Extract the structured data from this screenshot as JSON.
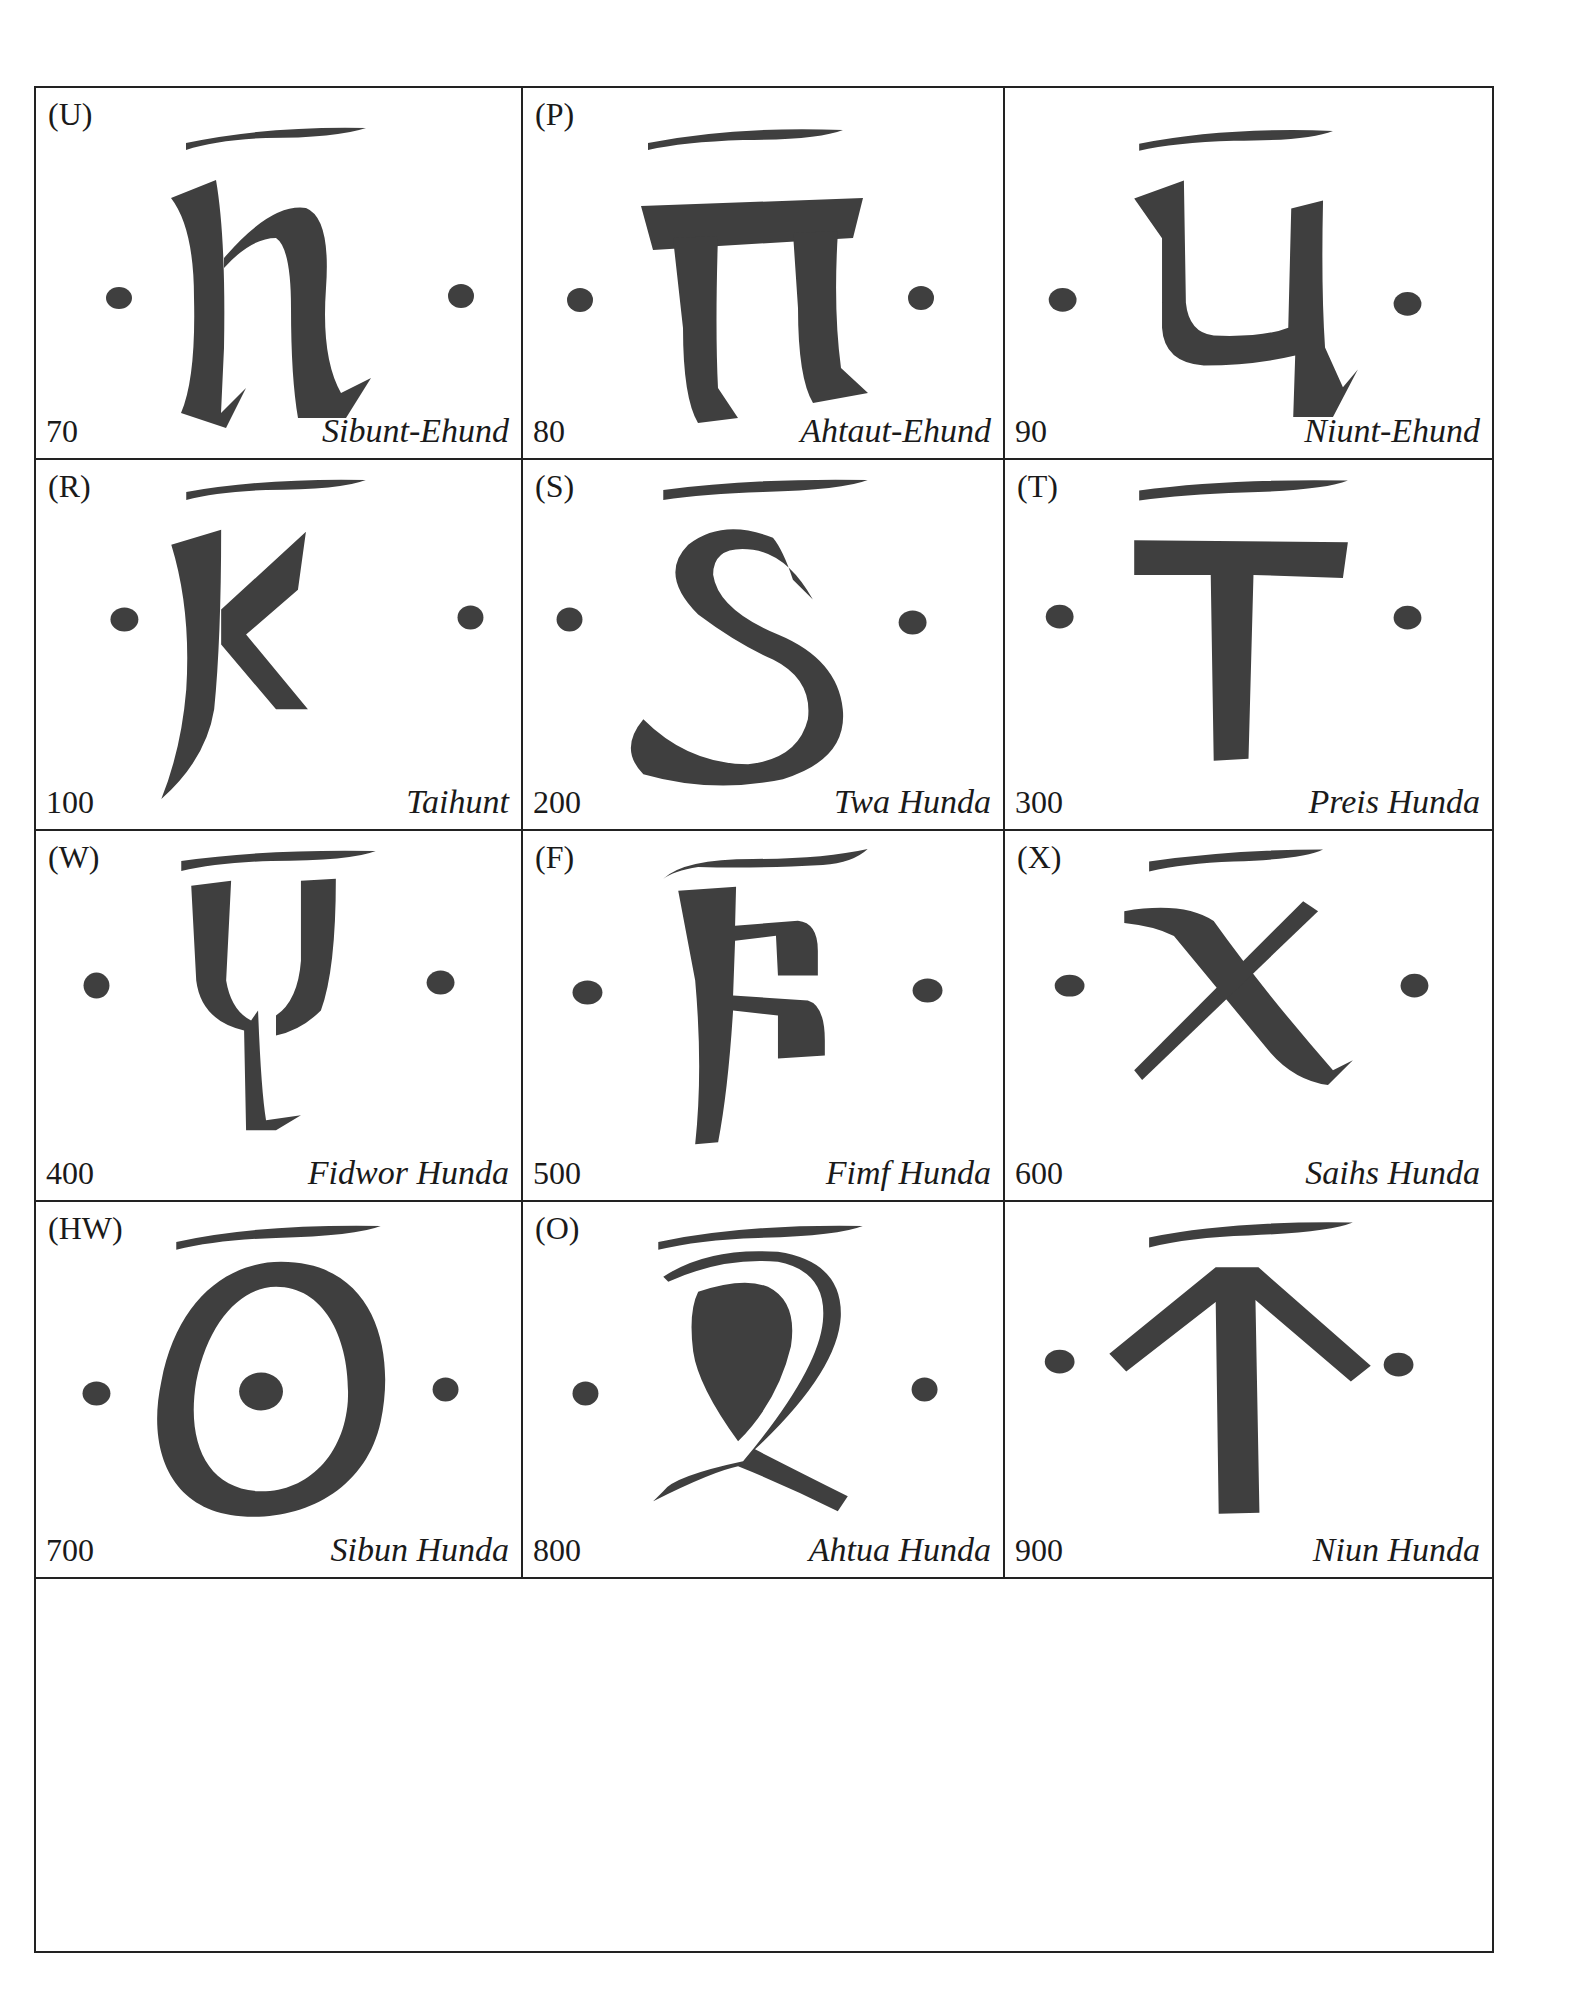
{
  "ink_color": "#3f3f3f",
  "rows": [
    {
      "cells": [
        {
          "letter": "(U)",
          "value": "70",
          "name": "Sibunt-Ehund",
          "glyph": "u-icon"
        },
        {
          "letter": "(P)",
          "value": "80",
          "name": "Ahtaut-Ehund",
          "glyph": "p-icon"
        },
        {
          "letter": "",
          "value": "90",
          "name": "Niunt-Ehund",
          "glyph": "q-icon"
        }
      ]
    },
    {
      "cells": [
        {
          "letter": "(R)",
          "value": "100",
          "name": "Taihunt",
          "glyph": "r-icon"
        },
        {
          "letter": "(S)",
          "value": "200",
          "name": "Twa Hunda",
          "glyph": "s-icon"
        },
        {
          "letter": "(T)",
          "value": "300",
          "name": "Preis Hunda",
          "glyph": "t-icon"
        }
      ]
    },
    {
      "cells": [
        {
          "letter": "(W)",
          "value": "400",
          "name": "Fidwor Hunda",
          "glyph": "w-icon"
        },
        {
          "letter": "(F)",
          "value": "500",
          "name": "Fimf Hunda",
          "glyph": "f-icon"
        },
        {
          "letter": "(X)",
          "value": "600",
          "name": "Saihs Hunda",
          "glyph": "x-icon"
        }
      ]
    },
    {
      "cells": [
        {
          "letter": "(HW)",
          "value": "700",
          "name": "Sibun Hunda",
          "glyph": "hw-icon"
        },
        {
          "letter": "(O)",
          "value": "800",
          "name": "Ahtua Hunda",
          "glyph": "o-icon"
        },
        {
          "letter": "",
          "value": "900",
          "name": "Niun Hunda",
          "glyph": "sampi-icon"
        }
      ]
    }
  ]
}
